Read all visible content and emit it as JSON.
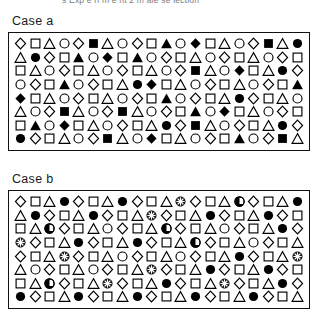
{
  "figure": {
    "top_caption_clipped": "s Exp e ri m e nt 2  m ale se lection",
    "shape_legend": {
      "diamond_open": "open-diamond",
      "square_open": "open-square",
      "triangle_open": "open-triangle",
      "circle_open": "open-circle",
      "diamond_filled": "filled-diamond",
      "square_filled": "filled-square",
      "triangle_filled": "filled-triangle",
      "circle_filled": "filled-circle",
      "circle_target_cross": "target-circle-crosshair",
      "circle_target_half": "target-circle-half"
    },
    "colors": {
      "ink": "#000000",
      "border": "#111111",
      "background": "#ffffff",
      "caption_gray": "#7b7b7b"
    }
  },
  "panels": [
    {
      "id": "case-a",
      "label": "Case a",
      "columns": 20,
      "rows_count": 8,
      "rows": [
        [
          "do",
          "so",
          "to",
          "co",
          "do",
          "sf",
          "to",
          "co",
          "do",
          "so",
          "tf",
          "co",
          "df",
          "so",
          "to",
          "co",
          "do",
          "sf",
          "to",
          "cf"
        ],
        [
          "to",
          "cf",
          "do",
          "so",
          "tf",
          "co",
          "df",
          "so",
          "tf",
          "co",
          "do",
          "so",
          "to",
          "co",
          "do",
          "so",
          "to",
          "co",
          "do",
          "so"
        ],
        [
          "so",
          "to",
          "co",
          "do",
          "so",
          "to",
          "co",
          "do",
          "so",
          "to",
          "co",
          "do",
          "sf",
          "to",
          "co",
          "df",
          "so",
          "to",
          "cf",
          "do"
        ],
        [
          "co",
          "do",
          "so",
          "tf",
          "co",
          "do",
          "so",
          "to",
          "cf",
          "df",
          "so",
          "to",
          "co",
          "do",
          "so",
          "to",
          "co",
          "do",
          "so",
          "tf"
        ],
        [
          "df",
          "so",
          "to",
          "co",
          "do",
          "so",
          "to",
          "co",
          "do",
          "so",
          "tf",
          "co",
          "do",
          "so",
          "to",
          "cf",
          "do",
          "so",
          "to",
          "co"
        ],
        [
          "to",
          "co",
          "do",
          "sf",
          "to",
          "co",
          "do",
          "sf",
          "to",
          "co",
          "do",
          "so",
          "tf",
          "co",
          "df",
          "so",
          "to",
          "co",
          "do",
          "so"
        ],
        [
          "so",
          "tf",
          "co",
          "df",
          "so",
          "to",
          "co",
          "do",
          "so",
          "to",
          "cf",
          "do",
          "sf",
          "to",
          "co",
          "do",
          "so",
          "to",
          "cf",
          "do"
        ],
        [
          "cf",
          "do",
          "so",
          "to",
          "co",
          "do",
          "sf",
          "to",
          "co",
          "df",
          "so",
          "to",
          "co",
          "do",
          "so",
          "tf",
          "co",
          "do",
          "sf",
          "to"
        ]
      ]
    },
    {
      "id": "case-b",
      "label": "Case b",
      "columns": 20,
      "rows_count": 8,
      "rows": [
        [
          "do",
          "so",
          "to",
          "cf",
          "do",
          "so",
          "to",
          "cf",
          "do",
          "so",
          "to",
          "tg1",
          "do",
          "so",
          "to",
          "tg2",
          "do",
          "so",
          "to",
          "cf"
        ],
        [
          "to",
          "cf",
          "do",
          "so",
          "to",
          "cf",
          "do",
          "so",
          "to",
          "tg1",
          "do",
          "so",
          "to",
          "cf",
          "do",
          "so",
          "to",
          "cf",
          "do",
          "so"
        ],
        [
          "so",
          "to",
          "tg2",
          "do",
          "so",
          "to",
          "co",
          "do",
          "so",
          "to",
          "tg2",
          "do",
          "so",
          "to",
          "co",
          "do",
          "so",
          "to",
          "cf",
          "do"
        ],
        [
          "tg1",
          "do",
          "so",
          "to",
          "cf",
          "do",
          "so",
          "to",
          "cf",
          "do",
          "so",
          "to",
          "tg2",
          "do",
          "so",
          "to",
          "co",
          "do",
          "so",
          "to"
        ],
        [
          "do",
          "so",
          "to",
          "tg1",
          "do",
          "so",
          "to",
          "co",
          "do",
          "so",
          "to",
          "co",
          "do",
          "so",
          "to",
          "cf",
          "do",
          "so",
          "to",
          "tg1"
        ],
        [
          "to",
          "co",
          "do",
          "so",
          "to",
          "co",
          "do",
          "so",
          "to",
          "tg1",
          "do",
          "so",
          "to",
          "cf",
          "do",
          "so",
          "to",
          "cf",
          "do",
          "so"
        ],
        [
          "so",
          "to",
          "tg2",
          "do",
          "so",
          "to",
          "tg1",
          "do",
          "so",
          "to",
          "cf",
          "do",
          "so",
          "to",
          "tg1",
          "do",
          "so",
          "to",
          "cf",
          "do"
        ],
        [
          "cf",
          "do",
          "so",
          "to",
          "cf",
          "do",
          "so",
          "to",
          "cf",
          "do",
          "so",
          "to",
          "cf",
          "do",
          "so",
          "to",
          "cf",
          "do",
          "so",
          "to"
        ]
      ]
    }
  ]
}
